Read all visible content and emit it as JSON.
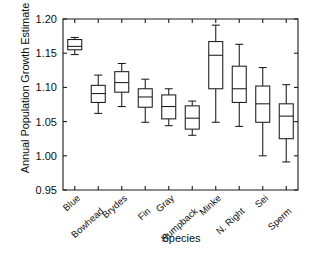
{
  "chart_data": {
    "type": "box",
    "title": "",
    "xlabel": "Species",
    "ylabel": "Annual Population Growth Estimate",
    "ylim": [
      0.95,
      1.2
    ],
    "yticks": [
      "0.95",
      "1.00",
      "1.05",
      "1.10",
      "1.15",
      "1.20"
    ],
    "ytick_values": [
      0.95,
      1.0,
      1.05,
      1.1,
      1.15,
      1.2
    ],
    "grid": false,
    "legend": "none",
    "categories": [
      "Blue",
      "Bowhead",
      "Brydes",
      "Fin",
      "Gray",
      "Humpback",
      "Minke",
      "N. Right",
      "Sei",
      "Sperm"
    ],
    "boxes": [
      {
        "category": "Blue",
        "whisker_low": 1.148,
        "q1": 1.155,
        "median": 1.16,
        "q3": 1.17,
        "whisker_high": 1.173
      },
      {
        "category": "Bowhead",
        "whisker_low": 1.062,
        "q1": 1.078,
        "median": 1.091,
        "q3": 1.103,
        "whisker_high": 1.118
      },
      {
        "category": "Brydes",
        "whisker_low": 1.072,
        "q1": 1.093,
        "median": 1.107,
        "q3": 1.123,
        "whisker_high": 1.135
      },
      {
        "category": "Fin",
        "whisker_low": 1.049,
        "q1": 1.071,
        "median": 1.086,
        "q3": 1.098,
        "whisker_high": 1.112
      },
      {
        "category": "Gray",
        "whisker_low": 1.044,
        "q1": 1.054,
        "median": 1.072,
        "q3": 1.089,
        "whisker_high": 1.098
      },
      {
        "category": "Humpback",
        "whisker_low": 1.03,
        "q1": 1.039,
        "median": 1.055,
        "q3": 1.073,
        "whisker_high": 1.08
      },
      {
        "category": "Minke",
        "whisker_low": 1.049,
        "q1": 1.098,
        "median": 1.147,
        "q3": 1.167,
        "whisker_high": 1.191
      },
      {
        "category": "N. Right",
        "whisker_low": 1.043,
        "q1": 1.078,
        "median": 1.098,
        "q3": 1.131,
        "whisker_high": 1.163
      },
      {
        "category": "Sei",
        "whisker_low": 1.0,
        "q1": 1.049,
        "median": 1.076,
        "q3": 1.102,
        "whisker_high": 1.129
      },
      {
        "category": "Sperm",
        "whisker_low": 0.991,
        "q1": 1.025,
        "median": 1.058,
        "q3": 1.076,
        "whisker_high": 1.104
      }
    ],
    "colors": {
      "line": "#1a1a1a",
      "box_fill": "#ffffff",
      "text": "#0d0d0d",
      "background": "#ffffff"
    }
  }
}
